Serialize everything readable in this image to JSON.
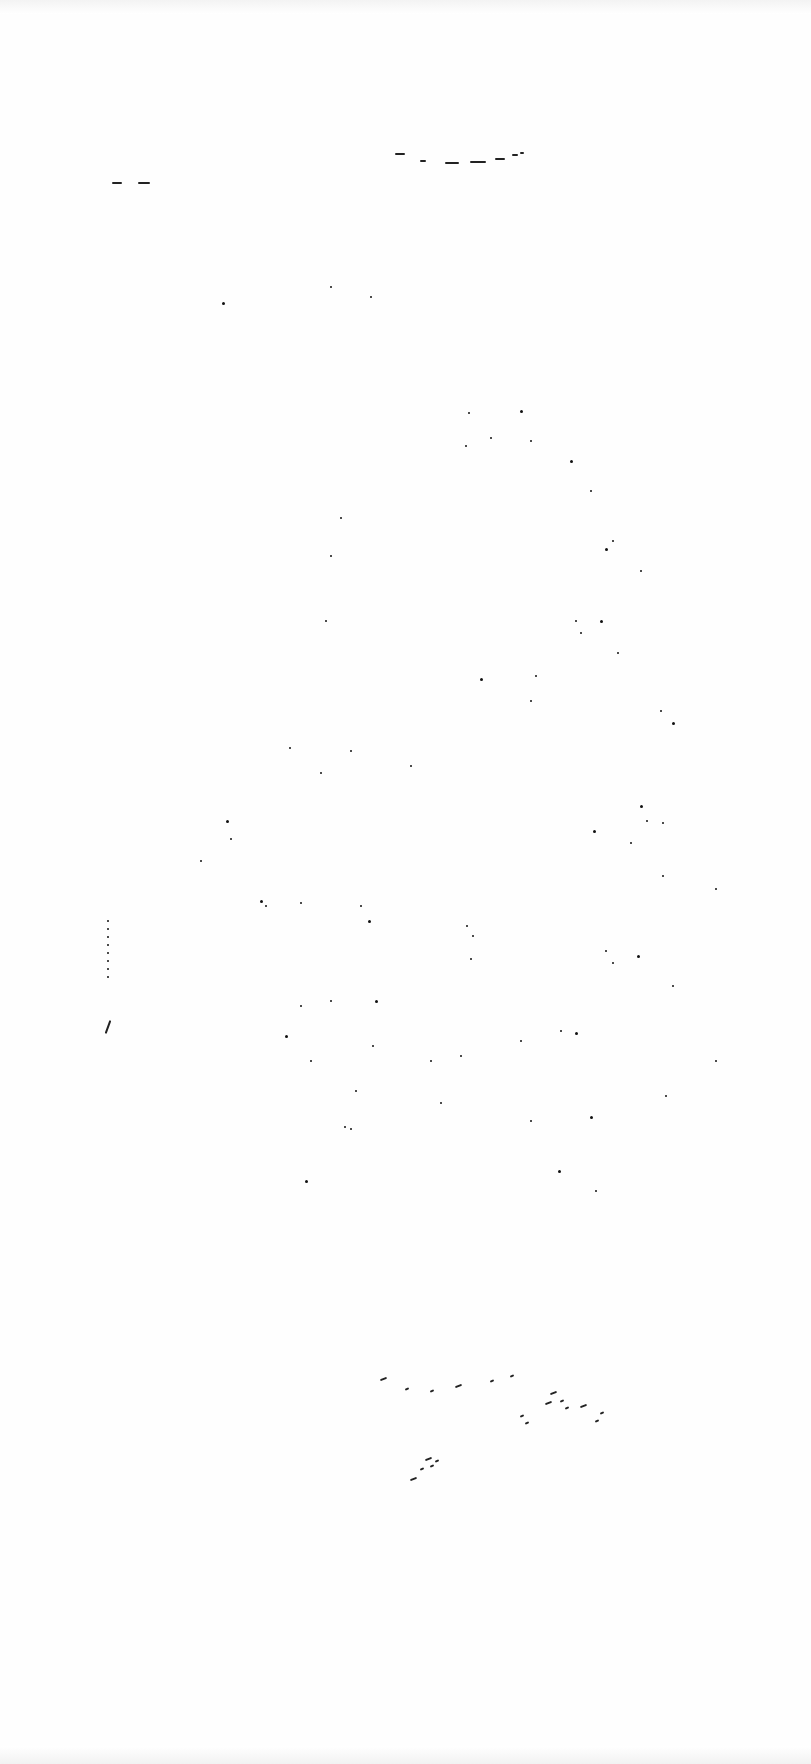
{
  "document": {
    "type": "scanned page",
    "legible_text": ""
  },
  "marks": {
    "header_arc": [
      [
        395,
        153,
        10
      ],
      [
        420,
        160,
        6
      ],
      [
        445,
        162,
        14
      ],
      [
        470,
        161,
        16
      ],
      [
        495,
        158,
        10
      ],
      [
        512,
        154,
        6
      ],
      [
        520,
        152,
        4
      ]
    ],
    "header_left_dashes": [
      [
        112,
        182,
        10
      ],
      [
        138,
        182,
        12
      ]
    ],
    "scatter_cluster": [
      [
        222,
        302
      ],
      [
        330,
        286
      ],
      [
        370,
        296
      ],
      [
        468,
        412
      ],
      [
        520,
        410
      ],
      [
        465,
        445
      ],
      [
        490,
        437
      ],
      [
        530,
        440
      ],
      [
        570,
        460
      ],
      [
        590,
        490
      ],
      [
        612,
        540
      ],
      [
        340,
        517
      ],
      [
        605,
        548
      ],
      [
        325,
        620
      ],
      [
        330,
        555
      ],
      [
        575,
        620
      ],
      [
        600,
        620
      ],
      [
        640,
        570
      ],
      [
        580,
        632
      ],
      [
        535,
        675
      ],
      [
        480,
        678
      ],
      [
        617,
        652
      ],
      [
        530,
        700
      ],
      [
        660,
        710
      ],
      [
        672,
        722
      ],
      [
        289,
        747
      ],
      [
        350,
        750
      ],
      [
        410,
        765
      ],
      [
        226,
        820
      ],
      [
        230,
        838
      ],
      [
        320,
        772
      ],
      [
        200,
        860
      ],
      [
        260,
        900
      ],
      [
        265,
        905
      ],
      [
        300,
        902
      ],
      [
        360,
        905
      ],
      [
        368,
        920
      ],
      [
        466,
        925
      ],
      [
        472,
        935
      ],
      [
        470,
        958
      ],
      [
        640,
        805
      ],
      [
        646,
        820
      ],
      [
        662,
        822
      ],
      [
        630,
        842
      ],
      [
        593,
        830
      ],
      [
        662,
        875
      ],
      [
        605,
        950
      ],
      [
        612,
        962
      ],
      [
        637,
        955
      ],
      [
        672,
        985
      ],
      [
        715,
        888
      ],
      [
        330,
        1000
      ],
      [
        375,
        1000
      ],
      [
        372,
        1045
      ],
      [
        355,
        1090
      ],
      [
        300,
        1005
      ],
      [
        285,
        1035
      ],
      [
        310,
        1060
      ],
      [
        520,
        1040
      ],
      [
        560,
        1030
      ],
      [
        575,
        1032
      ],
      [
        460,
        1055
      ],
      [
        430,
        1060
      ],
      [
        440,
        1102
      ],
      [
        305,
        1180
      ],
      [
        344,
        1126
      ],
      [
        350,
        1128
      ],
      [
        530,
        1120
      ],
      [
        590,
        1116
      ],
      [
        595,
        1190
      ],
      [
        665,
        1095
      ],
      [
        715,
        1060
      ],
      [
        558,
        1170
      ]
    ],
    "bottom_strokes": [
      [
        380,
        1378
      ],
      [
        405,
        1388
      ],
      [
        430,
        1390
      ],
      [
        455,
        1385
      ],
      [
        490,
        1380
      ],
      [
        510,
        1375
      ],
      [
        550,
        1392
      ],
      [
        560,
        1400
      ],
      [
        565,
        1407
      ],
      [
        545,
        1402
      ],
      [
        520,
        1415
      ],
      [
        525,
        1422
      ],
      [
        580,
        1405
      ],
      [
        600,
        1412
      ],
      [
        595,
        1420
      ],
      [
        410,
        1478
      ],
      [
        420,
        1468
      ],
      [
        430,
        1465
      ],
      [
        425,
        1458
      ],
      [
        435,
        1460
      ]
    ],
    "left_margin_mark": [
      107,
      960,
      8
    ]
  }
}
